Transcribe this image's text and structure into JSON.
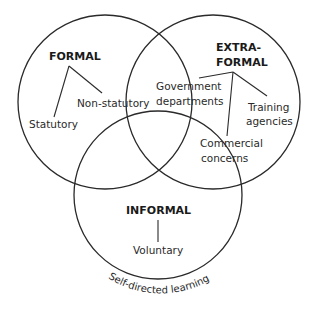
{
  "diagram": {
    "type": "venn",
    "sets": [
      {
        "id": "formal",
        "heading": "FORMAL",
        "items": [
          "Statutory",
          "Non-statutory"
        ]
      },
      {
        "id": "extra_formal",
        "heading_lines": [
          "EXTRA-",
          "FORMAL"
        ],
        "items": [
          {
            "lines": [
              "Government",
              "departments"
            ]
          },
          {
            "lines": [
              "Training",
              "agencies"
            ]
          },
          {
            "lines": [
              "Commercial",
              "concerns"
            ]
          }
        ]
      },
      {
        "id": "informal",
        "heading": "INFORMAL",
        "items": [
          "Voluntary"
        ]
      }
    ],
    "caption_arc": "Self-directed learning",
    "colors": {
      "stroke": "#2a2a2a",
      "text": "#1a1a1a",
      "background": "#ffffff"
    }
  }
}
